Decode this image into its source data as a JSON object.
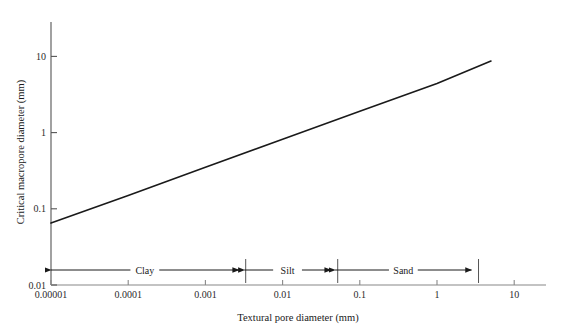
{
  "chart_data": {
    "type": "line",
    "title": "",
    "xlabel": "Textural pore diameter (mm)",
    "ylabel": "Critical macropore diameter (mm)",
    "xscale": "log",
    "yscale": "log",
    "xlim": [
      1e-05,
      30
    ],
    "ylim": [
      0.01,
      20
    ],
    "grid": false,
    "legend": "none",
    "xticks": [
      {
        "value": 1e-05,
        "label": "0.00001"
      },
      {
        "value": 0.0001,
        "label": "0.0001"
      },
      {
        "value": 0.001,
        "label": "0.001"
      },
      {
        "value": 0.01,
        "label": "0.01"
      },
      {
        "value": 0.1,
        "label": "0.1"
      },
      {
        "value": 1,
        "label": "1"
      },
      {
        "value": 10,
        "label": "10"
      }
    ],
    "yticks": [
      {
        "value": 0.01,
        "label": "0.01"
      },
      {
        "value": 0.1,
        "label": "0.1"
      },
      {
        "value": 1,
        "label": "1"
      },
      {
        "value": 10,
        "label": "10"
      }
    ],
    "series": [
      {
        "name": "Critical macropore diameter",
        "color": "#1a1a1a",
        "x": [
          1e-05,
          0.0001,
          0.001,
          0.01,
          0.1,
          1,
          5
        ],
        "y": [
          0.065,
          0.15,
          0.35,
          0.82,
          1.9,
          4.4,
          8.7
        ]
      }
    ],
    "annotations": [
      {
        "name": "clay-band",
        "label": "Clay",
        "x_start": 1e-05,
        "x_end": 0.0027
      },
      {
        "name": "silt-band",
        "label": "Silt",
        "x_start": 0.0032,
        "x_end": 0.042
      },
      {
        "name": "sand-band",
        "label": "Sand",
        "x_start": 0.048,
        "x_end": 2.8
      }
    ]
  }
}
